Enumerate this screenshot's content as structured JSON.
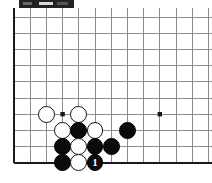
{
  "window": {
    "titlebar_color": "#232323",
    "title": ""
  },
  "board": {
    "game": "Go",
    "background_color": "#ffffff",
    "line_color": "#8c8c8c",
    "border_color": "#1a1a1a",
    "grid": {
      "origin_x": 14,
      "origin_y": 9,
      "spacing": 16.2,
      "cols": 13,
      "rows": 9,
      "left_edge_is_board_edge": true,
      "bottom_edge_is_board_edge": true,
      "top_cropped": true,
      "right_cropped": true
    },
    "star_points": [
      {
        "col": 3,
        "row": 6
      },
      {
        "col": 9,
        "row": 6
      }
    ],
    "stone_radius": 8.4,
    "stones": [
      {
        "color": "white",
        "col": 2,
        "row": 6,
        "label": ""
      },
      {
        "color": "white",
        "col": 4,
        "row": 6,
        "label": ""
      },
      {
        "color": "white",
        "col": 3,
        "row": 7,
        "label": ""
      },
      {
        "color": "black",
        "col": 4,
        "row": 7,
        "label": ""
      },
      {
        "color": "white",
        "col": 5,
        "row": 7,
        "label": ""
      },
      {
        "color": "black",
        "col": 7,
        "row": 7,
        "label": ""
      },
      {
        "color": "black",
        "col": 3,
        "row": 8,
        "label": ""
      },
      {
        "color": "white",
        "col": 4,
        "row": 8,
        "label": ""
      },
      {
        "color": "black",
        "col": 5,
        "row": 8,
        "label": ""
      },
      {
        "color": "black",
        "col": 6,
        "row": 8,
        "label": ""
      },
      {
        "color": "black",
        "col": 3,
        "row": 9,
        "label": ""
      },
      {
        "color": "white",
        "col": 4,
        "row": 9,
        "label": ""
      },
      {
        "color": "black",
        "col": 5,
        "row": 9,
        "label": "1"
      }
    ]
  }
}
